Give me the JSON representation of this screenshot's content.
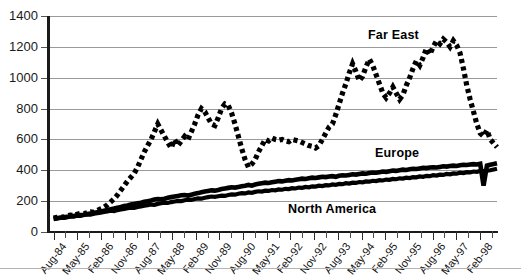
{
  "chart_data": {
    "type": "line",
    "title": "",
    "xlabel": "",
    "ylabel": "",
    "ylim": [
      0,
      1400
    ],
    "ytick_step": 200,
    "yticks": [
      "0",
      "200",
      "400",
      "600",
      "800",
      "1000",
      "1200",
      "1400"
    ],
    "grid": "horizontal",
    "legend_position": "inline-annotations",
    "x_tick_labels": [
      "Aug-84",
      "May-85",
      "Feb-86",
      "Nov-86",
      "Aug-87",
      "May-88",
      "Feb-89",
      "Nov-89",
      "Aug-90",
      "May-91",
      "Feb-92",
      "Nov-92",
      "Aug-93",
      "May-94",
      "Feb-95",
      "Nov-95",
      "Aug-96",
      "May-97",
      "Feb-98"
    ],
    "x_minor_ticks_between_labels": 1,
    "series": [
      {
        "name": "Far East",
        "style": "dotted",
        "color": "#000000",
        "values": [
          90,
          95,
          100,
          96,
          105,
          110,
          108,
          115,
          120,
          118,
          125,
          130,
          128,
          140,
          150,
          160,
          175,
          195,
          215,
          240,
          270,
          300,
          330,
          355,
          380,
          420,
          470,
          520,
          560,
          600,
          650,
          700,
          660,
          620,
          580,
          545,
          600,
          560,
          590,
          620,
          600,
          650,
          700,
          760,
          800,
          780,
          740,
          700,
          690,
          740,
          800,
          830,
          820,
          770,
          700,
          620,
          540,
          470,
          420,
          440,
          470,
          520,
          560,
          600,
          590,
          610,
          600,
          595,
          600,
          590,
          585,
          600,
          595,
          590,
          580,
          570,
          560,
          555,
          545,
          560,
          600,
          640,
          680,
          700,
          760,
          830,
          900,
          960,
          1030,
          1090,
          1040,
          980,
          1010,
          1070,
          1120,
          1080,
          1020,
          960,
          900,
          870,
          900,
          940,
          900,
          860,
          890,
          950,
          1000,
          1060,
          1110,
          1080,
          1130,
          1190,
          1150,
          1200,
          1240,
          1220,
          1250,
          1230,
          1200,
          1240,
          1210,
          1160,
          1060,
          950,
          860,
          780,
          700,
          640,
          620,
          660,
          600,
          575,
          550
        ]
      },
      {
        "name": "Europe",
        "style": "solid",
        "color": "#000000",
        "values": [
          85,
          88,
          92,
          95,
          98,
          100,
          104,
          108,
          110,
          112,
          116,
          120,
          124,
          128,
          132,
          138,
          142,
          148,
          152,
          158,
          162,
          168,
          172,
          178,
          182,
          186,
          190,
          196,
          200,
          204,
          210,
          214,
          212,
          216,
          222,
          226,
          230,
          234,
          238,
          240,
          236,
          242,
          248,
          252,
          258,
          262,
          266,
          270,
          268,
          272,
          278,
          282,
          286,
          290,
          288,
          292,
          296,
          300,
          305,
          300,
          308,
          312,
          316,
          320,
          318,
          322,
          326,
          330,
          328,
          332,
          336,
          334,
          338,
          342,
          346,
          344,
          348,
          352,
          350,
          354,
          358,
          356,
          360,
          362,
          358,
          364,
          368,
          366,
          370,
          374,
          372,
          376,
          380,
          378,
          382,
          386,
          384,
          388,
          392,
          390,
          394,
          398,
          396,
          400,
          404,
          402,
          406,
          410,
          408,
          412,
          416,
          414,
          418,
          420,
          418,
          422,
          426,
          424,
          428,
          430,
          428,
          432,
          436,
          434,
          438,
          440,
          438,
          442,
          300,
          430,
          436,
          440,
          445
        ]
      },
      {
        "name": "North America",
        "style": "solid",
        "color": "#000000",
        "values": [
          88,
          90,
          94,
          92,
          96,
          102,
          100,
          106,
          104,
          110,
          114,
          112,
          118,
          122,
          126,
          130,
          134,
          138,
          136,
          142,
          146,
          150,
          154,
          158,
          156,
          162,
          166,
          170,
          174,
          178,
          176,
          182,
          186,
          190,
          188,
          194,
          198,
          202,
          200,
          206,
          210,
          208,
          214,
          218,
          216,
          222,
          226,
          230,
          228,
          232,
          236,
          234,
          240,
          244,
          242,
          248,
          252,
          250,
          256,
          254,
          260,
          264,
          262,
          268,
          266,
          272,
          270,
          276,
          274,
          280,
          278,
          284,
          282,
          288,
          286,
          292,
          290,
          296,
          294,
          300,
          298,
          304,
          302,
          308,
          306,
          312,
          310,
          316,
          314,
          320,
          318,
          324,
          322,
          328,
          326,
          332,
          330,
          336,
          334,
          340,
          338,
          344,
          342,
          348,
          346,
          352,
          350,
          356,
          354,
          360,
          358,
          364,
          362,
          368,
          366,
          372,
          370,
          376,
          374,
          380,
          378,
          384,
          382,
          388,
          386,
          392,
          390,
          396,
          394,
          398,
          400,
          405,
          410
        ]
      }
    ],
    "annotations": [
      {
        "text": "Far East",
        "series": "Far East"
      },
      {
        "text": "Europe",
        "series": "Europe"
      },
      {
        "text": "North America",
        "series": "North America"
      }
    ]
  }
}
